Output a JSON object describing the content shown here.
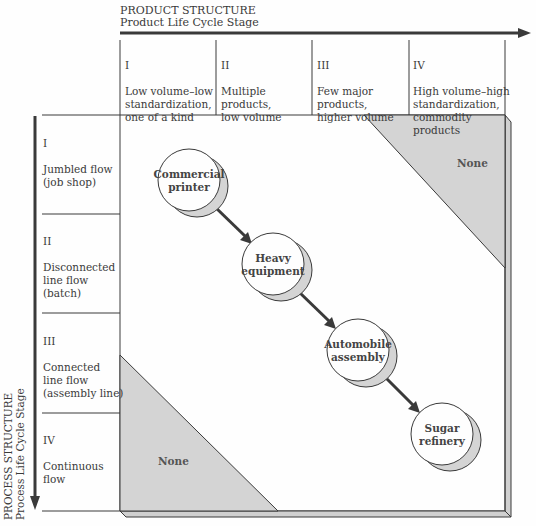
{
  "product_structure": {
    "title": "PRODUCT STRUCTURE",
    "subtitle": "Product Life Cycle Stage",
    "columns": [
      {
        "numeral": "I",
        "text": "Low volume–low\nstandardization,\none of a kind"
      },
      {
        "numeral": "II",
        "text": "Multiple\nproducts,\nlow volume"
      },
      {
        "numeral": "III",
        "text": "Few major\nproducts,\nhigher volume"
      },
      {
        "numeral": "IV",
        "text": "High volume–high\nstandardization,\ncommodity\nproducts"
      }
    ]
  },
  "process_structure": {
    "title": "PROCESS STRUCTURE",
    "subtitle": "Process Life Cycle Stage",
    "rows": [
      {
        "numeral": "I",
        "text": "Jumbled flow\n(job shop)"
      },
      {
        "numeral": "II",
        "text": "Disconnected\nline flow\n(batch)"
      },
      {
        "numeral": "III",
        "text": "Connected\nline flow\n(assembly line)"
      },
      {
        "numeral": "IV",
        "text": "Continuous\nflow"
      }
    ]
  },
  "matrix": {
    "nodes": [
      {
        "label": "Commercial\nprinter"
      },
      {
        "label": "Heavy\nequipment"
      },
      {
        "label": "Automobile\nassembly"
      },
      {
        "label": "Sugar\nrefinery"
      }
    ],
    "empty_regions": [
      {
        "position": "top-right",
        "label": "None"
      },
      {
        "position": "bottom-left",
        "label": "None"
      }
    ]
  },
  "colors": {
    "line": "#3a3a3a",
    "shade": "#d4d4d4",
    "frame": "#bdbdbd",
    "background": "#fefefe"
  }
}
